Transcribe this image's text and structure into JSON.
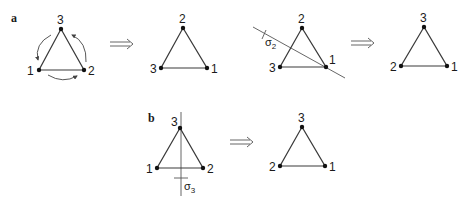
{
  "panels": {
    "a": {
      "label": "a",
      "triangles": [
        {
          "id": "a1",
          "top": "3",
          "left": "1",
          "right": "2",
          "rotation_arrows": true
        },
        {
          "id": "a2",
          "top": "2",
          "left": "3",
          "right": "1"
        },
        {
          "id": "a3",
          "top": "2",
          "left": "3",
          "right": "1",
          "mirror": "σ",
          "mirror_sub": "2"
        },
        {
          "id": "a4",
          "top": "3",
          "left": "2",
          "right": "1"
        }
      ],
      "arrows": [
        "⟹",
        "⟹"
      ]
    },
    "b": {
      "label": "b",
      "triangles": [
        {
          "id": "b1",
          "top": "3",
          "left": "1",
          "right": "2",
          "mirror": "σ",
          "mirror_sub": "3"
        },
        {
          "id": "b2",
          "top": "3",
          "left": "2",
          "right": "1"
        }
      ],
      "arrows": [
        "⟹"
      ]
    }
  },
  "colors": {
    "line": "#3a3a3a",
    "vertex": "#111111",
    "background": "#ffffff"
  }
}
